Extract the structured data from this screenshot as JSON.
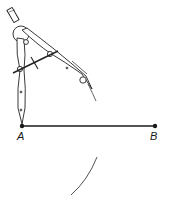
{
  "diagram": {
    "type": "geometric-construction",
    "points": {
      "A": {
        "label": "A",
        "x": 22,
        "y": 126
      },
      "B": {
        "label": "B",
        "x": 155,
        "y": 126
      }
    },
    "segment": {
      "from": "A",
      "to": "B"
    },
    "arcs": [
      {
        "name": "upper-arc",
        "center": "A"
      },
      {
        "name": "lower-arc",
        "center": "A"
      }
    ],
    "tool": "compass",
    "colors": {
      "ink": "#1a1a1a",
      "arc": "#555555",
      "background": "#ffffff"
    }
  }
}
